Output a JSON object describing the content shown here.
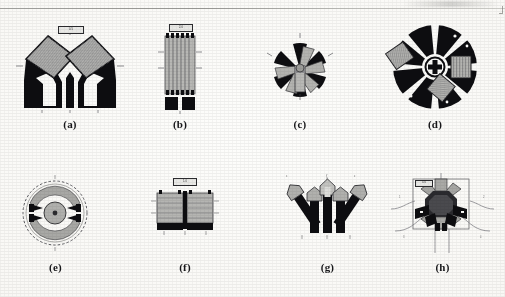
{
  "page": {
    "background_color": "#fbfbf9",
    "ink_color": "#0d0d10",
    "gray_fill_color": "#a9a9a7",
    "rule_color": "#9a9a96",
    "figure_count": 8,
    "rows": 2,
    "columns": 4
  },
  "figures": [
    {
      "id": "a",
      "caption": "(a)",
      "description": "two mirrored tetrahedral wedge sensor elements with hatched square pads and black V-shaped bodies",
      "callout_label": "0.5",
      "leader_labels": [
        "A",
        "B",
        "C",
        "D",
        "E"
      ]
    },
    {
      "id": "b",
      "caption": "(b)",
      "description": "vertical multi-strip gauge grid with terminal pads at top and two black solder tabs at bottom",
      "callout_label": "2.0",
      "leader_labels": [
        "a",
        "b",
        "c",
        "d"
      ]
    },
    {
      "id": "c",
      "caption": "(c)",
      "description": "six-petal radial rosette with alternating black petals and hatched gray blades around a central stem",
      "callout_label": "",
      "leader_labels": [
        "1",
        "2",
        "3"
      ]
    },
    {
      "id": "d",
      "caption": "(d)",
      "description": "circular disc rotor with eight black sectors, three hatched inset pads and a cruciform center hub",
      "callout_label": "",
      "leader_labels": [
        "1",
        "2",
        "3",
        "4"
      ]
    },
    {
      "id": "e",
      "caption": "(e)",
      "description": "dashed outer circle enclosing two gray arcs, a round central hub and four black arrow pole pieces",
      "callout_label": "",
      "leader_labels": [
        "a",
        "b"
      ]
    },
    {
      "id": "f",
      "caption": "(f)",
      "description": "two side-by-side rectangular hatched gauge blocks with black base tabs and a top callout box",
      "callout_label": "1.0",
      "leader_labels": [
        "p",
        "q",
        "r",
        "s"
      ]
    },
    {
      "id": "g",
      "caption": "(g)",
      "description": "five chevron arrow elements, outer pair splayed, with gray heads and black stems",
      "callout_label": "",
      "leader_labels": [
        "x",
        "y",
        "z"
      ]
    },
    {
      "id": "h",
      "caption": "(h)",
      "description": "square frame assembly with a dark octagonal core, four gray wedge arms, black arrow pole pieces and curved lead wires",
      "callout_label": "3.0",
      "leader_labels": [
        "1",
        "2",
        "3",
        "4",
        "5"
      ]
    }
  ]
}
